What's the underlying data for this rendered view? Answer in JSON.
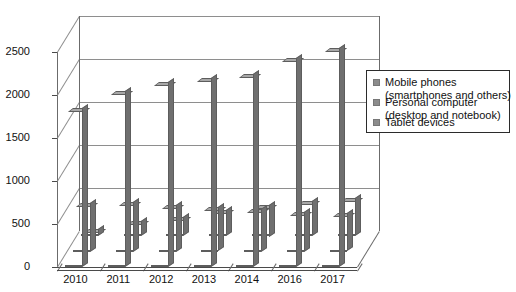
{
  "chart_data": {
    "type": "bar",
    "title": "",
    "xlabel": "",
    "ylabel": "",
    "ylim": [
      0,
      2500
    ],
    "yticks": [
      0,
      500,
      1000,
      1500,
      2000,
      2500
    ],
    "ytick_labels": [
      "0",
      "500",
      "1000",
      "1500",
      "2000",
      "2500"
    ],
    "categories": [
      "2010",
      "2011",
      "2012",
      "2013",
      "2014",
      "2016",
      "2017"
    ],
    "grid": true,
    "legend_position": "right",
    "style": "3d-column",
    "series": [
      {
        "name": "Mobile phones (smartphones and others)",
        "color": "#8c8c8c",
        "values": [
          1800,
          2000,
          2100,
          2150,
          2200,
          2380,
          2500
        ]
      },
      {
        "name": "Personal computer (desktop and notebook)",
        "color": "#8c8c8c",
        "values": [
          520,
          530,
          500,
          470,
          450,
          420,
          400
        ]
      },
      {
        "name": "Tablet devices",
        "color": "#8c8c8c",
        "values": [
          40,
          130,
          180,
          260,
          320,
          360,
          400
        ]
      }
    ]
  },
  "legend": {
    "items": [
      {
        "line1": "Mobile phones",
        "line2": "(smartphones and others)"
      },
      {
        "line1": "Personal computer",
        "line2": "(desktop and notebook)"
      },
      {
        "line1": "Tablet devices",
        "line2": ""
      }
    ]
  },
  "colors": {
    "bar_front": "#8c8c8c",
    "bar_top": "#a8a8a8",
    "bar_side": "#6f6f6f",
    "bar_edge": "#5d5d5d",
    "grid": "#8e8e8e",
    "axis": "#4a4a4a",
    "text": "#111111",
    "legend_border": "#2b2b2b",
    "background": "#ffffff"
  }
}
